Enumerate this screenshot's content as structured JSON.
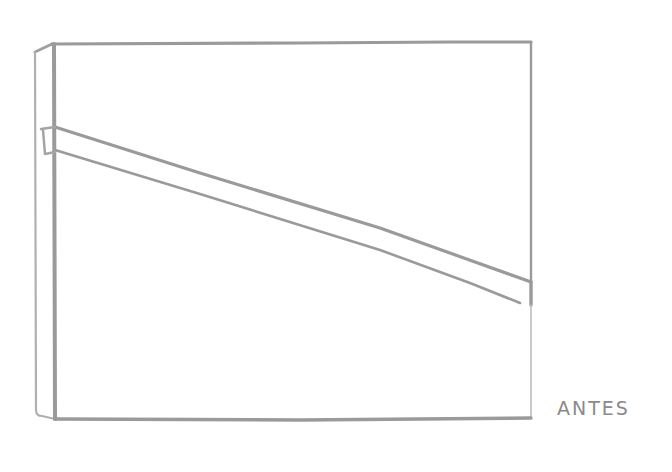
{
  "diagram": {
    "label": "ANTES",
    "stroke_color": "#9a9a9a",
    "stroke_color_light": "#b5b5b5",
    "background": "#ffffff",
    "elements": {
      "front_panel": {
        "x1": 55,
        "y1": 43,
        "x2": 531,
        "y2": 420
      },
      "side_panel": {
        "left_x": 35,
        "right_x": 55,
        "top_y": 48,
        "bottom_y": 418
      },
      "diagonal_beam": {
        "top_edge": {
          "from": [
            55,
            127
          ],
          "to": [
            531,
            282
          ]
        },
        "bottom_edge": {
          "from": [
            55,
            150
          ],
          "to": [
            520,
            305
          ]
        },
        "end_cap_x": 531
      },
      "beam_bracket": {
        "x1": 42,
        "y1": 128,
        "x2": 55,
        "y2": 152
      }
    }
  }
}
